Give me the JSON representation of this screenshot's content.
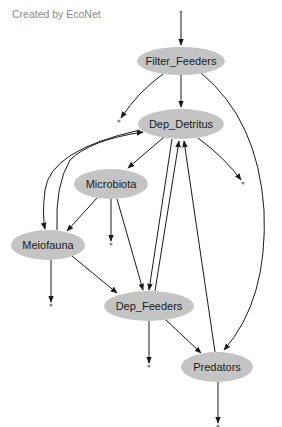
{
  "credit": "Created by EcoNet",
  "colors": {
    "node_fill": "#c4c4c4",
    "edge": "#1a1a1a",
    "terminal": "#8a8a8a"
  },
  "diagram": {
    "type": "ecological-flow-network",
    "nodes": [
      {
        "id": "Filter_Feeders",
        "label": "Filter_Feeders",
        "cx": 181,
        "cy": 61,
        "rx": 44,
        "ry": 14
      },
      {
        "id": "Dep_Detritus",
        "label": "Dep_Detritus",
        "cx": 181,
        "cy": 124,
        "rx": 43,
        "ry": 15
      },
      {
        "id": "Microbiota",
        "label": "Microbiota",
        "cx": 111,
        "cy": 184,
        "rx": 37,
        "ry": 15
      },
      {
        "id": "Meiofauna",
        "label": "Meiofauna",
        "cx": 48,
        "cy": 245,
        "rx": 37,
        "ry": 15
      },
      {
        "id": "Dep_Feeders",
        "label": "Dep_Feeders",
        "cx": 149,
        "cy": 306,
        "rx": 45,
        "ry": 15
      },
      {
        "id": "Predators",
        "label": "Predators",
        "cx": 217,
        "cy": 367,
        "rx": 36,
        "ry": 15
      }
    ],
    "edges": [
      {
        "from": "input",
        "to": "Filter_Feeders"
      },
      {
        "from": "Filter_Feeders",
        "to": "Dep_Detritus"
      },
      {
        "from": "Filter_Feeders",
        "to": "Predators"
      },
      {
        "from": "Filter_Feeders",
        "to": "output"
      },
      {
        "from": "Dep_Detritus",
        "to": "Microbiota"
      },
      {
        "from": "Dep_Detritus",
        "to": "Meiofauna"
      },
      {
        "from": "Dep_Detritus",
        "to": "Dep_Feeders"
      },
      {
        "from": "Dep_Detritus",
        "to": "output"
      },
      {
        "from": "Microbiota",
        "to": "Meiofauna"
      },
      {
        "from": "Microbiota",
        "to": "Dep_Feeders"
      },
      {
        "from": "Microbiota",
        "to": "output"
      },
      {
        "from": "Meiofauna",
        "to": "Dep_Detritus"
      },
      {
        "from": "Meiofauna",
        "to": "Dep_Feeders"
      },
      {
        "from": "Meiofauna",
        "to": "output"
      },
      {
        "from": "Dep_Feeders",
        "to": "Dep_Detritus"
      },
      {
        "from": "Dep_Feeders",
        "to": "Predators"
      },
      {
        "from": "Dep_Feeders",
        "to": "output"
      },
      {
        "from": "Predators",
        "to": "Dep_Detritus"
      },
      {
        "from": "Predators",
        "to": "output"
      }
    ]
  }
}
